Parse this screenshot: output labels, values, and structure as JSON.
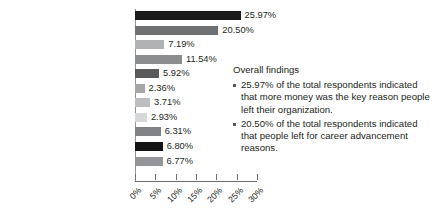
{
  "chart_data": {
    "type": "bar",
    "orientation": "horizontal",
    "title": "",
    "xlabel": "",
    "ylabel": "",
    "xlim": [
      0,
      30
    ],
    "grid": false,
    "legend": false,
    "categories": [
      "More money",
      "Career advancement",
      "Cultural fit",
      "Change of industry",
      "Redundancy/retrenchment",
      "Maternity leave",
      "Moved interstate",
      "Went travelling",
      "Moved overseas",
      "Job security",
      "Employer values"
    ],
    "values": [
      25.97,
      20.5,
      7.19,
      11.54,
      5.92,
      2.36,
      3.71,
      2.93,
      6.31,
      6.8,
      6.77
    ],
    "value_labels": [
      "25.97%",
      "20.50%",
      "7.19%",
      "11.54%",
      "5.92%",
      "2.36%",
      "3.71%",
      "2.93%",
      "6.31%",
      "6.80%",
      "6.77%"
    ],
    "bar_colors": [
      "#1a1a1a",
      "#6f7072",
      "#b0b2b4",
      "#8a8c8e",
      "#58595b",
      "#a4a6a9",
      "#bcbec0",
      "#d6d8da",
      "#808285",
      "#141414",
      "#949699"
    ],
    "tick_values": [
      0,
      5,
      10,
      15,
      20,
      25,
      30
    ],
    "tick_labels": [
      "0%",
      "5%",
      "10%",
      "15%",
      "20%",
      "25%",
      "30%"
    ]
  },
  "findings": {
    "title": "Overall findings",
    "items": [
      "25.97% of the total respondents indicated that more money was the key reason people left their organization.",
      "20.50% of the total respondents indicated that people left for career advancement reasons."
    ]
  }
}
